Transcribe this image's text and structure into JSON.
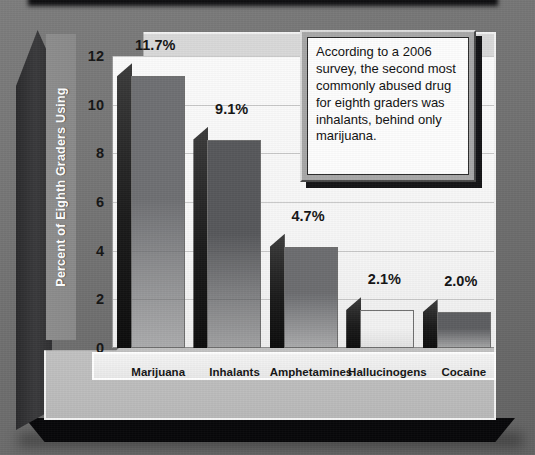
{
  "chart_data": {
    "type": "bar",
    "title": "",
    "xlabel": "",
    "ylabel": "Percent of Eighth Graders Using",
    "ylim": [
      0,
      12
    ],
    "yticks": [
      0,
      2,
      4,
      6,
      8,
      10,
      12
    ],
    "ytick_labels": [
      "0",
      "2",
      "4",
      "6",
      "8",
      "10",
      "12"
    ],
    "grid": true,
    "legend": "none",
    "categories": [
      "Marijuana",
      "Inhalants",
      "Amphetamines",
      "Hallucinogens",
      "Cocaine"
    ],
    "values": [
      11.7,
      9.1,
      4.7,
      2.1,
      2.0
    ],
    "value_labels": [
      "11.7%",
      "9.1%",
      "4.7%",
      "2.1%",
      "2.0%"
    ],
    "bar_face_colors": [
      "#6f7073",
      "#57585b",
      "#6c6d70",
      "#f2f2f2",
      "#5d5e61"
    ],
    "annotations": [
      "According to a 2006 survey, the second most commonly abused drug for eighth graders was inhalants, behind only marijuana."
    ]
  },
  "callout": {
    "text": "According to a 2006 survey, the second most commonly abused drug for eighth graders was inhalants, behind only marijuana."
  },
  "colors": {
    "panel_background": "#d0d0d0",
    "plot_background": "#fbfbfb",
    "gridline": "#c8c8c8",
    "axis_title_band": "#8d8d8d",
    "axis_title_text": "#ffffff",
    "base_slab": "#08080a",
    "backdrop": "#737373"
  }
}
